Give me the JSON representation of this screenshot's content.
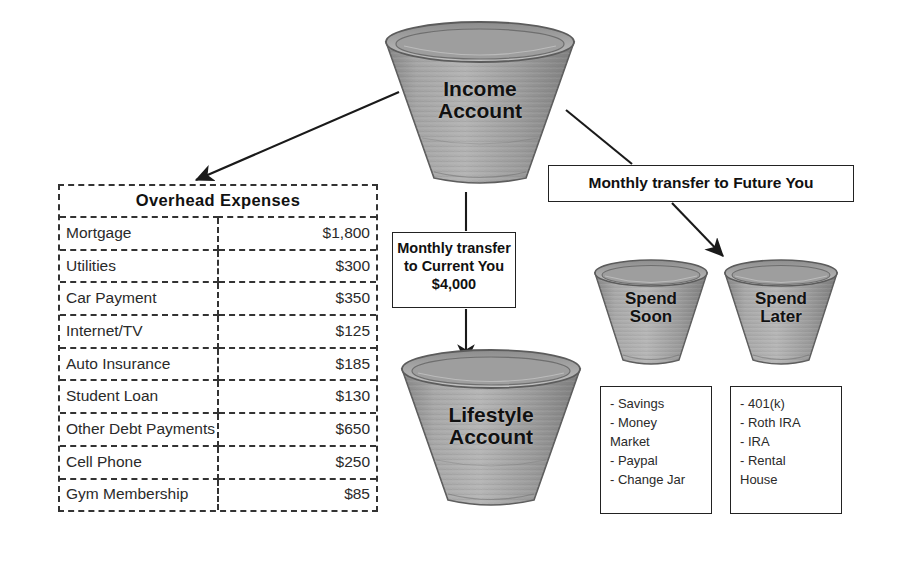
{
  "overhead": {
    "title": "Overhead Expenses",
    "columns": [
      "Expense",
      "Amount"
    ],
    "rows": [
      {
        "label": "Mortgage",
        "amount": "$1,800"
      },
      {
        "label": "Utilities",
        "amount": "$300"
      },
      {
        "label": "Car Payment",
        "amount": "$350"
      },
      {
        "label": "Internet/TV",
        "amount": "$125"
      },
      {
        "label": "Auto Insurance",
        "amount": "$185"
      },
      {
        "label": "Student Loan",
        "amount": "$130"
      },
      {
        "label": "Other Debt Payments",
        "amount": "$650"
      },
      {
        "label": "Cell Phone",
        "amount": "$250"
      },
      {
        "label": "Gym Membership",
        "amount": "$85"
      }
    ]
  },
  "buckets": {
    "income": "Income\nAccount",
    "lifestyle": "Lifestyle\nAccount",
    "spend_soon": "Spend\nSoon",
    "spend_later": "Spend\nLater"
  },
  "callouts": {
    "current_you": "Monthly transfer\nto Current You\n$4,000",
    "future_you": "Monthly transfer to Future You"
  },
  "lists": {
    "spend_soon": [
      "- Savings",
      "- Money\n  Market",
      "- Paypal",
      "- Change Jar"
    ],
    "spend_later": [
      "- 401(k)",
      "- Roth IRA",
      "- IRA",
      "- Rental\n  House"
    ]
  },
  "colors": {
    "bucket_body": "#9a9a9a",
    "bucket_shadow": "#7a7a7a",
    "bucket_highlight": "#b9b9b9",
    "bucket_rim": "#8e8e8e",
    "outline": "#4a4a4a",
    "ink": "#1a1a1a",
    "background": "#ffffff"
  }
}
